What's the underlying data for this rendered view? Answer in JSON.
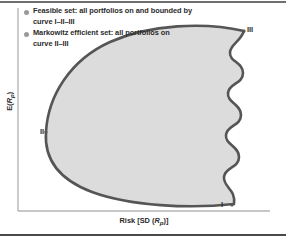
{
  "figure": {
    "type": "markowitz-efficient-frontier-diagram",
    "legend": {
      "items": [
        {
          "bullet": "circle-bullet",
          "line1": "Feasible set: all portfolios on and bounded by",
          "line2": "curve I–II–III"
        },
        {
          "bullet": "circle-bullet",
          "line1": "Markowitz efficient set: all portfolios on",
          "line2": "curve II–III"
        }
      ]
    },
    "axes": {
      "x_label_prefix": "Risk [SD (",
      "x_label_var": "R",
      "x_label_sub": "p",
      "x_label_suffix": ")]",
      "y_label_prefix": "E(",
      "y_label_var": "R",
      "y_label_sub": "p",
      "y_label_suffix": ")"
    },
    "points": [
      {
        "id": "point-III",
        "label": "III"
      },
      {
        "id": "point-II",
        "label": "II"
      },
      {
        "id": "point-I",
        "label": "I"
      }
    ],
    "colors": {
      "fill": "#dcdcdc",
      "stroke": "#555555",
      "axis": "#b5b5b5",
      "rule_top": "#6f6f6f",
      "rule_bottom": "#4a4a4a",
      "text": "#2b2b2b",
      "bullet": "#9a9a9a"
    }
  }
}
